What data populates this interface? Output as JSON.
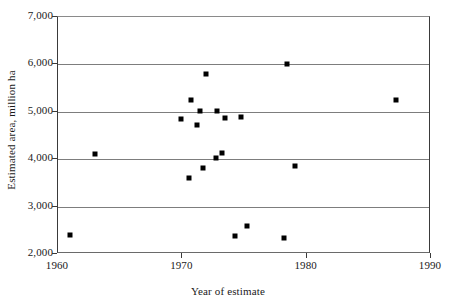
{
  "chart_data": {
    "type": "scatter",
    "title": "",
    "xlabel": "Year of estimate",
    "ylabel": "Estimated area, million ha",
    "xlim": [
      1960,
      1990
    ],
    "ylim": [
      2000,
      7000
    ],
    "xticks": [
      "1960",
      "1970",
      "1980",
      "1990"
    ],
    "xtick_values": [
      1960,
      1970,
      1980,
      1990
    ],
    "yticks": [
      "2,000",
      "3,000",
      "4,000",
      "5,000",
      "6,000",
      "7,000"
    ],
    "ytick_values": [
      2000,
      3000,
      4000,
      5000,
      6000,
      7000
    ],
    "grid": "horizontal",
    "legend": "none",
    "marker": "filled-square",
    "marker_color": "#000000",
    "points": [
      {
        "x": 1961.0,
        "y": 2400
      },
      {
        "x": 1963.0,
        "y": 4110
      },
      {
        "x": 1969.9,
        "y": 4850
      },
      {
        "x": 1970.7,
        "y": 5250
      },
      {
        "x": 1970.5,
        "y": 3610
      },
      {
        "x": 1971.2,
        "y": 4720
      },
      {
        "x": 1971.9,
        "y": 5790
      },
      {
        "x": 1971.4,
        "y": 5020
      },
      {
        "x": 1971.7,
        "y": 3820
      },
      {
        "x": 1972.8,
        "y": 5020
      },
      {
        "x": 1972.7,
        "y": 4030
      },
      {
        "x": 1973.2,
        "y": 4140
      },
      {
        "x": 1973.4,
        "y": 4870
      },
      {
        "x": 1974.2,
        "y": 2380
      },
      {
        "x": 1974.7,
        "y": 4880
      },
      {
        "x": 1975.2,
        "y": 2600
      },
      {
        "x": 1978.2,
        "y": 2330
      },
      {
        "x": 1978.4,
        "y": 6000
      },
      {
        "x": 1979.1,
        "y": 3850
      },
      {
        "x": 1987.2,
        "y": 5240
      }
    ]
  }
}
